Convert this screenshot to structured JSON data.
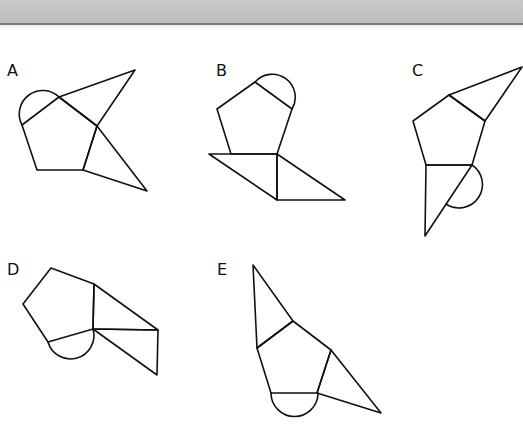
{
  "header": {
    "band_color": "#c4c4c4",
    "rule_color": "#7a7a7a"
  },
  "options": [
    {
      "label": "A",
      "label_pos": [
        7,
        63
      ]
    },
    {
      "label": "B",
      "label_pos": [
        216,
        63
      ]
    },
    {
      "label": "C",
      "label_pos": [
        412,
        63
      ]
    },
    {
      "label": "D",
      "label_pos": [
        7,
        262
      ]
    },
    {
      "label": "E",
      "label_pos": [
        217,
        262
      ]
    }
  ],
  "style": {
    "stroke": "#111111",
    "stroke_width": 1.6
  }
}
